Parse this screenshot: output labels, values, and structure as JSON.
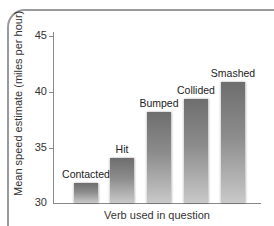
{
  "chart_data": {
    "type": "bar",
    "title": "",
    "xlabel": "Verb used in question",
    "ylabel": "Mean speed estimate (miles per hour)",
    "categories": [
      "Contacted",
      "Hit",
      "Bumped",
      "Collided",
      "Smashed"
    ],
    "values": [
      31.8,
      34.0,
      38.1,
      39.3,
      40.8
    ],
    "ylim": [
      30,
      45
    ],
    "yticks": [
      "30",
      "35",
      "40",
      "45"
    ],
    "grid": false,
    "legend": null,
    "bar_color": "#7a7a7a"
  },
  "axis": {
    "ylabel": "Mean speed estimate (miles per hour)",
    "xlabel": "Verb used in question",
    "ticks": [
      "45",
      "40",
      "35",
      "30"
    ]
  },
  "bars": [
    {
      "label": "Contacted",
      "value": 31.8
    },
    {
      "label": "Hit",
      "value": 34.0
    },
    {
      "label": "Bumped",
      "value": 38.1
    },
    {
      "label": "Collided",
      "value": 39.3
    },
    {
      "label": "Smashed",
      "value": 40.8
    }
  ]
}
